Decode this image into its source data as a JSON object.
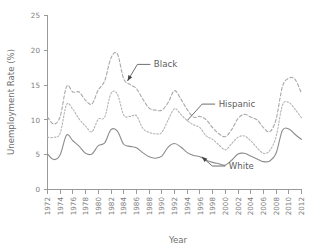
{
  "chart_data": {
    "type": "line",
    "title": "",
    "xlabel": "Year",
    "ylabel": "Unemployment Rate (%)",
    "xlim": [
      1972,
      2012
    ],
    "ylim": [
      0,
      25
    ],
    "yticks": [
      0,
      5,
      10,
      15,
      20,
      25
    ],
    "xticks": [
      1972,
      1974,
      1976,
      1978,
      1980,
      1982,
      1984,
      1986,
      1988,
      1990,
      1992,
      1994,
      1996,
      1998,
      2000,
      2002,
      2004,
      2006,
      2008,
      2010,
      2012
    ],
    "grid": false,
    "legend_position": "inline-annotations",
    "x": [
      1972,
      1973,
      1974,
      1975,
      1976,
      1977,
      1978,
      1979,
      1980,
      1981,
      1982,
      1983,
      1984,
      1985,
      1986,
      1987,
      1988,
      1989,
      1990,
      1991,
      1992,
      1993,
      1994,
      1995,
      1996,
      1997,
      1998,
      1999,
      2000,
      2001,
      2002,
      2003,
      2004,
      2005,
      2006,
      2007,
      2008,
      2009,
      2010,
      2011,
      2012
    ],
    "series": [
      {
        "name": "Black",
        "style": "long-dashed",
        "color": "#a8a8a8",
        "values": [
          10.4,
          9.4,
          10.5,
          14.8,
          14.0,
          14.0,
          12.8,
          12.3,
          14.3,
          15.6,
          18.9,
          19.5,
          15.9,
          15.1,
          14.5,
          13.0,
          11.7,
          11.4,
          11.4,
          12.5,
          14.2,
          13.0,
          11.5,
          10.4,
          10.5,
          10.0,
          8.9,
          8.0,
          7.6,
          8.6,
          10.2,
          10.8,
          10.4,
          10.0,
          8.9,
          8.3,
          10.1,
          14.8,
          16.0,
          15.8,
          13.8
        ]
      },
      {
        "name": "Hispanic",
        "style": "short-dashed",
        "color": "#b4b4b4",
        "values": [
          7.5,
          7.5,
          8.1,
          12.2,
          11.5,
          10.1,
          9.1,
          8.3,
          10.1,
          10.4,
          13.8,
          13.7,
          10.7,
          10.5,
          10.6,
          8.8,
          8.2,
          8.0,
          8.2,
          10.0,
          11.6,
          10.8,
          9.9,
          9.3,
          8.9,
          7.7,
          7.2,
          6.4,
          5.7,
          6.6,
          7.5,
          7.7,
          7.0,
          6.0,
          5.2,
          5.6,
          7.6,
          12.1,
          12.5,
          11.5,
          10.3
        ]
      },
      {
        "name": "White",
        "style": "solid",
        "color": "#8c8c8c",
        "values": [
          5.1,
          4.3,
          5.0,
          7.8,
          7.0,
          6.2,
          5.2,
          5.1,
          6.3,
          6.7,
          8.6,
          8.4,
          6.5,
          6.2,
          6.0,
          5.3,
          4.7,
          4.5,
          4.8,
          6.1,
          6.6,
          6.1,
          5.3,
          4.9,
          4.7,
          4.2,
          3.9,
          3.7,
          3.5,
          4.2,
          5.1,
          5.2,
          4.8,
          4.4,
          4.0,
          4.1,
          5.2,
          8.5,
          8.7,
          7.9,
          7.2
        ]
      }
    ],
    "annotations": [
      {
        "text": "Black",
        "label_x": 1988.2,
        "label_y": 17.6,
        "point_x": 1984.6,
        "point_y": 15.6,
        "arrow": true
      },
      {
        "text": "Hispanic",
        "label_x": 1998.4,
        "label_y": 11.9,
        "point_x": 1994.0,
        "point_y": 9.9,
        "arrow": false
      },
      {
        "text": "White",
        "label_x": 2000.0,
        "label_y": 3.0,
        "point_x": 1996.3,
        "point_y": 4.7,
        "arrow": true
      }
    ]
  }
}
